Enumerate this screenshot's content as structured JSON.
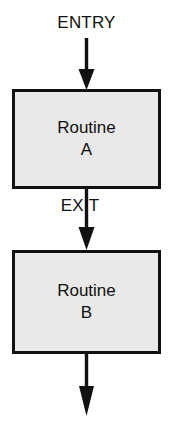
{
  "diagram": {
    "type": "flowchart",
    "background_color": "#ffffff",
    "line_color": "#111111",
    "box_fill_color": "#e9e9e9",
    "box_border_color": "#111111",
    "text_color": "#101010",
    "labels": {
      "entry": "ENTRY",
      "exit": "EXIT"
    },
    "nodes": [
      {
        "id": "routine-a",
        "shape": "rectangle",
        "lines": [
          "Routine",
          "A"
        ]
      },
      {
        "id": "routine-b",
        "shape": "rectangle",
        "lines": [
          "Routine",
          "B"
        ]
      }
    ],
    "connectors": [
      {
        "id": "entry-arrow",
        "from": "entry-label",
        "to": "routine-a",
        "direction": "down",
        "arrowhead": "solid-triangle"
      },
      {
        "id": "a-to-b-arrow",
        "from": "routine-a",
        "to": "routine-b",
        "direction": "down",
        "arrowhead": "solid-triangle",
        "label": "EXIT"
      },
      {
        "id": "exit-arrow",
        "from": "routine-b",
        "to": "",
        "direction": "down",
        "arrowhead": "solid-triangle"
      }
    ]
  }
}
